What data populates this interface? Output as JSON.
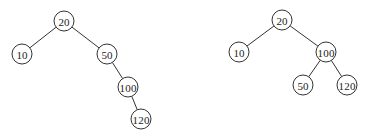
{
  "colors": {
    "stroke": "#333333",
    "text": "#222222",
    "background": "#ffffff"
  },
  "node_radius": 10,
  "trees": [
    {
      "name": "tree-before-rotation",
      "nodes": [
        {
          "id": "a20",
          "label": "20",
          "x": 64,
          "y": 21
        },
        {
          "id": "a10",
          "label": "10",
          "x": 22,
          "y": 54
        },
        {
          "id": "a50",
          "label": "50",
          "x": 107,
          "y": 54
        },
        {
          "id": "a100",
          "label": "100",
          "x": 128,
          "y": 87
        },
        {
          "id": "a120",
          "label": "120",
          "x": 141,
          "y": 119
        }
      ],
      "edges": [
        [
          "a20",
          "a10"
        ],
        [
          "a20",
          "a50"
        ],
        [
          "a50",
          "a100"
        ],
        [
          "a100",
          "a120"
        ]
      ]
    },
    {
      "name": "tree-after-rotation",
      "nodes": [
        {
          "id": "b20",
          "label": "20",
          "x": 282,
          "y": 20
        },
        {
          "id": "b10",
          "label": "10",
          "x": 239,
          "y": 52
        },
        {
          "id": "b100",
          "label": "100",
          "x": 326,
          "y": 52
        },
        {
          "id": "b50",
          "label": "50",
          "x": 303,
          "y": 85
        },
        {
          "id": "b120",
          "label": "120",
          "x": 347,
          "y": 85
        }
      ],
      "edges": [
        [
          "b20",
          "b10"
        ],
        [
          "b20",
          "b100"
        ],
        [
          "b100",
          "b50"
        ],
        [
          "b100",
          "b120"
        ]
      ]
    }
  ]
}
